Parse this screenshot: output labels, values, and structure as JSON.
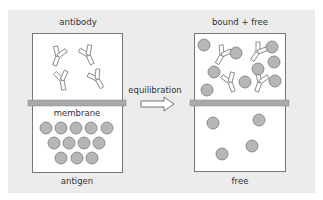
{
  "diagram": {
    "title_left_top": "antibody",
    "title_left_membrane": "membrane",
    "title_left_bottom": "antigen",
    "title_right_top": "bound + free",
    "title_right_bottom": "free",
    "arrow_label": "equilibration",
    "colors": {
      "background": "#ececec",
      "box_fill": "#ffffff",
      "box_stroke": "#777777",
      "membrane": "#a9a9a9",
      "antigen_fill": "#b6b6b6",
      "antigen_stroke": "#7a7a7a",
      "antibody_stroke": "#7a7a7a"
    },
    "left_chamber": {
      "antibodies": 4,
      "antigens": 12
    },
    "right_chamber": {
      "upper_bound_antibodies": 4,
      "upper_antigens": 9,
      "lower_free_antigens": 4
    }
  }
}
